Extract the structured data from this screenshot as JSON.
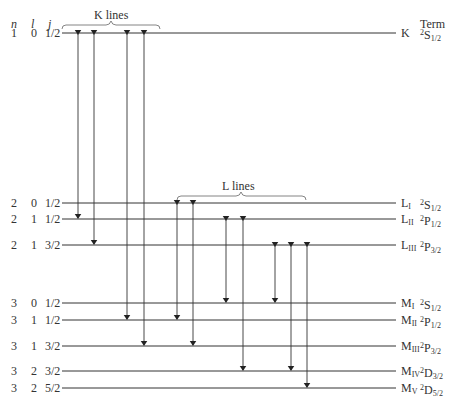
{
  "headers": {
    "n": "n",
    "l": "l",
    "j": "j",
    "term": "Term"
  },
  "group_labels": {
    "k_lines": "K lines",
    "l_lines": "L lines"
  },
  "levels": [
    {
      "n": "1",
      "l": "0",
      "j": "1/2",
      "shell": "K",
      "shell_sub": "",
      "mult": "2",
      "letter": "S",
      "jsub": "1/2",
      "y": 33
    },
    {
      "n": "2",
      "l": "0",
      "j": "1/2",
      "shell": "L",
      "shell_sub": "I",
      "mult": "2",
      "letter": "S",
      "jsub": "1/2",
      "y": 203
    },
    {
      "n": "2",
      "l": "1",
      "j": "1/2",
      "shell": "L",
      "shell_sub": "II",
      "mult": "2",
      "letter": "P",
      "jsub": "1/2",
      "y": 219
    },
    {
      "n": "2",
      "l": "1",
      "j": "3/2",
      "shell": "L",
      "shell_sub": "III",
      "mult": "2",
      "letter": "P",
      "jsub": "3/2",
      "y": 245
    },
    {
      "n": "3",
      "l": "0",
      "j": "1/2",
      "shell": "M",
      "shell_sub": "I",
      "mult": "2",
      "letter": "S",
      "jsub": "1/2",
      "y": 303
    },
    {
      "n": "3",
      "l": "1",
      "j": "1/2",
      "shell": "M",
      "shell_sub": "II",
      "mult": "2",
      "letter": "P",
      "jsub": "1/2",
      "y": 320
    },
    {
      "n": "3",
      "l": "1",
      "j": "3/2",
      "shell": "M",
      "shell_sub": "III",
      "mult": "2",
      "letter": "P",
      "jsub": "3/2",
      "y": 346
    },
    {
      "n": "3",
      "l": "2",
      "j": "3/2",
      "shell": "M",
      "shell_sub": "IV",
      "mult": "2",
      "letter": "D",
      "jsub": "3/2",
      "y": 371
    },
    {
      "n": "3",
      "l": "2",
      "j": "5/2",
      "shell": "M",
      "shell_sub": "V",
      "mult": "2",
      "letter": "D",
      "jsub": "5/2",
      "y": 388
    }
  ],
  "transitions": [
    {
      "from": "K",
      "to": "LI",
      "x": 78,
      "y1": 33,
      "y2": 219,
      "dir": "both"
    },
    {
      "from": "K",
      "to": "LII",
      "x": 94,
      "y1": 33,
      "y2": 245,
      "dir": "both"
    },
    {
      "from": "K",
      "to": "MII",
      "x": 127,
      "y1": 33,
      "y2": 320,
      "dir": "both"
    },
    {
      "from": "K",
      "to": "MIII",
      "x": 144,
      "y1": 33,
      "y2": 346,
      "dir": "both"
    },
    {
      "from": "LI",
      "to": "MII",
      "x": 177,
      "y1": 203,
      "y2": 320,
      "dir": "both"
    },
    {
      "from": "LI",
      "to": "MIII",
      "x": 193,
      "y1": 203,
      "y2": 346,
      "dir": "both"
    },
    {
      "from": "LII",
      "to": "MI",
      "x": 226,
      "y1": 219,
      "y2": 303,
      "dir": "both"
    },
    {
      "from": "LII",
      "to": "MIV",
      "x": 243,
      "y1": 219,
      "y2": 371,
      "dir": "both"
    },
    {
      "from": "LIII",
      "to": "MI",
      "x": 275,
      "y1": 245,
      "y2": 303,
      "dir": "both"
    },
    {
      "from": "LIII",
      "to": "MIV",
      "x": 291,
      "y1": 245,
      "y2": 371,
      "dir": "both"
    },
    {
      "from": "LIII",
      "to": "MV",
      "x": 307,
      "y1": 245,
      "y2": 388,
      "dir": "both"
    }
  ]
}
